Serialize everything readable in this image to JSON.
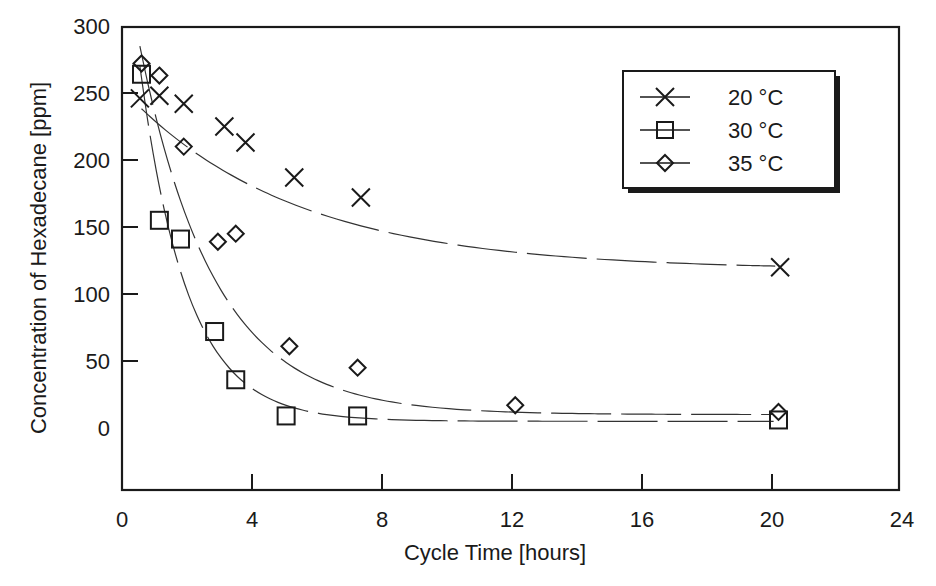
{
  "chart_data": {
    "type": "line",
    "title": "",
    "xlabel": "Cycle Time [hours]",
    "ylabel": "Concentration of Hexadecane [ppm]",
    "xlim": [
      0,
      24
    ],
    "ylim": [
      -46,
      300
    ],
    "xticks": [
      0,
      4,
      8,
      12,
      16,
      20,
      24
    ],
    "yticks": [
      0,
      50,
      100,
      150,
      200,
      250,
      300
    ],
    "grid": false,
    "legend_position": "upper right",
    "series": [
      {
        "name": "20 °C",
        "marker": "x",
        "line_style": "dashed smooth fit",
        "x": [
          0.55,
          1.15,
          1.9,
          3.15,
          3.8,
          5.3,
          7.35,
          20.25
        ],
        "y": [
          246,
          248,
          242,
          225,
          213,
          187,
          172,
          120
        ]
      },
      {
        "name": "30 °C",
        "marker": "square",
        "line_style": "dashed smooth fit",
        "x": [
          0.6,
          1.15,
          1.8,
          2.85,
          3.5,
          5.05,
          7.25,
          20.2
        ],
        "y": [
          264,
          155,
          141,
          72,
          36,
          9,
          9,
          6
        ]
      },
      {
        "name": "35 °C",
        "marker": "diamond",
        "line_style": "dashed smooth fit",
        "x": [
          0.6,
          1.15,
          1.9,
          2.95,
          3.5,
          5.15,
          7.25,
          12.1,
          20.2
        ],
        "y": [
          272,
          263,
          210,
          139,
          145,
          61,
          45,
          17,
          12
        ]
      }
    ]
  },
  "labels": {
    "x_title": "Cycle Time [hours]",
    "y_title": "Concentration of Hexadecane [ppm]",
    "x_ticks": [
      "0",
      "4",
      "8",
      "12",
      "16",
      "20",
      "24"
    ],
    "y_ticks": [
      "0",
      "50",
      "100",
      "150",
      "200",
      "250",
      "300"
    ],
    "legend": [
      "20 °C",
      "30 °C",
      "35 °C"
    ]
  }
}
